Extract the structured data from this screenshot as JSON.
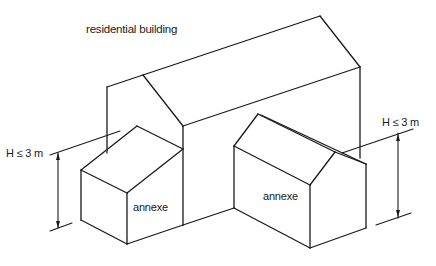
{
  "diagram": {
    "title": "residential building",
    "annexes": [
      {
        "label": "annexe"
      },
      {
        "label": "annexe"
      }
    ],
    "dimensions": [
      {
        "label": "H ≤ 3 m",
        "side": "left"
      },
      {
        "label": "H ≤ 3 m",
        "side": "right"
      }
    ],
    "colors": {
      "line": "#1a1a1a",
      "background": "#ffffff"
    }
  }
}
